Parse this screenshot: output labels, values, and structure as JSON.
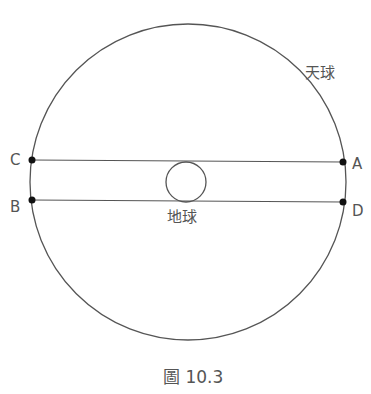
{
  "diagram": {
    "caption": "圖 10.3",
    "celestial_sphere_label": "天球",
    "earth_label": "地球",
    "points": {
      "A": "A",
      "B": "B",
      "C": "C",
      "D": "D"
    },
    "lines": [
      "C-A",
      "B-D"
    ],
    "colors": {
      "stroke": "#555555",
      "dot": "#111111",
      "text": "#555555"
    }
  }
}
